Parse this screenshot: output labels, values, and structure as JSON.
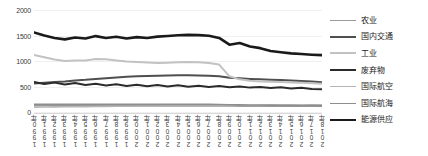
{
  "chart_data": {
    "type": "line",
    "title": "",
    "xlabel": "",
    "ylabel": "",
    "ylim": [
      0,
      2000
    ],
    "yticks": [
      0,
      500,
      1000,
      1500,
      2000
    ],
    "ytick_labels": [
      "0",
      "500",
      "1000",
      "1500",
      "2000"
    ],
    "grid": true,
    "legend_position": "right",
    "categories": [
      "1990年",
      "1991年",
      "1992年",
      "1993年",
      "1994年",
      "1995年",
      "1996年",
      "1997年",
      "1998年",
      "1999年",
      "2000年",
      "2001年",
      "2002年",
      "2003年",
      "2004年",
      "2005年",
      "2006年",
      "2007年",
      "2008年",
      "2009年",
      "2010年",
      "2011年",
      "2012年",
      "2013年",
      "2014年",
      "2015年",
      "2016年",
      "2017年",
      "2018年"
    ],
    "series": [
      {
        "name": "农业",
        "color": "#9a9a9a",
        "width": 1.6,
        "values": [
          130,
          129,
          128,
          127,
          126,
          125,
          124,
          124,
          123,
          122,
          122,
          121,
          121,
          120,
          120,
          119,
          119,
          118,
          118,
          117,
          116,
          116,
          115,
          115,
          114,
          114,
          113,
          113,
          112
        ]
      },
      {
        "name": "国内交通",
        "color": "#4f4f4f",
        "width": 2.0,
        "values": [
          560,
          572,
          588,
          600,
          618,
          630,
          648,
          662,
          678,
          692,
          700,
          706,
          712,
          716,
          720,
          722,
          718,
          712,
          700,
          672,
          660,
          648,
          640,
          632,
          626,
          620,
          608,
          596,
          584
        ]
      },
      {
        "name": "工业",
        "color": "#c2c2c2",
        "width": 2.0,
        "values": [
          1120,
          1075,
          1030,
          1000,
          1008,
          1012,
          1040,
          1036,
          1010,
          988,
          980,
          970,
          962,
          968,
          974,
          980,
          976,
          962,
          930,
          700,
          640,
          612,
          600,
          592,
          586,
          580,
          572,
          564,
          556
        ]
      },
      {
        "name": "废弃物",
        "color": "#2b2b2b",
        "width": 2.0,
        "values": [
          590,
          548,
          576,
          540,
          568,
          530,
          552,
          520,
          544,
          512,
          536,
          506,
          530,
          500,
          524,
          496,
          516,
          490,
          510,
          486,
          500,
          478,
          492,
          470,
          484,
          462,
          474,
          452,
          446
        ]
      },
      {
        "name": "国际航空",
        "color": "#b5b5b5",
        "width": 1.6,
        "values": [
          96,
          98,
          100,
          102,
          104,
          106,
          108,
          110,
          112,
          114,
          116,
          117,
          118,
          120,
          122,
          124,
          126,
          128,
          128,
          124,
          126,
          128,
          130,
          132,
          134,
          136,
          138,
          140,
          142
        ]
      },
      {
        "name": "国际航海",
        "color": "#8e8e8e",
        "width": 1.6,
        "values": [
          150,
          150,
          150,
          150,
          150,
          150,
          150,
          150,
          150,
          150,
          150,
          150,
          150,
          150,
          150,
          150,
          150,
          150,
          148,
          142,
          140,
          138,
          136,
          134,
          132,
          130,
          128,
          126,
          124
        ]
      },
      {
        "name": "能源供应",
        "color": "#1a1a1a",
        "width": 2.6,
        "values": [
          1560,
          1500,
          1452,
          1424,
          1462,
          1440,
          1488,
          1452,
          1476,
          1440,
          1468,
          1452,
          1478,
          1490,
          1504,
          1512,
          1508,
          1496,
          1452,
          1320,
          1352,
          1286,
          1252,
          1196,
          1172,
          1150,
          1136,
          1124,
          1116
        ]
      }
    ]
  },
  "legend": {
    "items": [
      {
        "label": "农业"
      },
      {
        "label": "国内交通"
      },
      {
        "label": "工业"
      },
      {
        "label": "废弃物"
      },
      {
        "label": "国际航空"
      },
      {
        "label": "国际航海"
      },
      {
        "label": "能源供应"
      }
    ]
  }
}
